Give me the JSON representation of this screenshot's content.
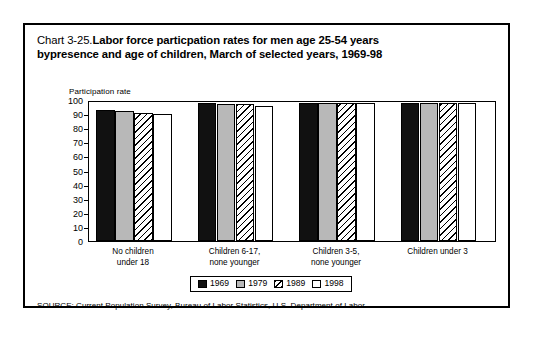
{
  "figure": {
    "title_number": "Chart 3-25.",
    "title_line1_bold": "Labor force particpation rates for men age 25-54 years",
    "title_line2": "bypresence and age of children, March of selected years, 1969-98",
    "axis_title": "Participation rate",
    "source": "SOURCE: Current Population Survey, Bureau of Labor Statistics, U.S. Department of Labor"
  },
  "chart_data": {
    "type": "bar",
    "xlabel": "",
    "ylabel": "Participation rate",
    "ylim": [
      0,
      100
    ],
    "yticks": [
      0,
      10,
      20,
      30,
      40,
      50,
      60,
      70,
      80,
      90,
      100
    ],
    "ytick_labels": [
      "0",
      "10",
      "20",
      "30",
      "40",
      "50",
      "60",
      "70",
      "80",
      "90",
      "100"
    ],
    "grid": false,
    "legend_position": "bottom-center",
    "categories": [
      "No children under 18",
      "Children 6-17, none younger",
      "Children 3-5, none younger",
      "Children under 3"
    ],
    "category_lines": [
      [
        "No children",
        "under 18"
      ],
      [
        "Children 6-17,",
        "none younger"
      ],
      [
        "Children 3-5,",
        "none younger"
      ],
      [
        "Children under 3"
      ]
    ],
    "series": [
      {
        "name": "1969",
        "fill": "black",
        "color": "#111111",
        "values": [
          93,
          98,
          98,
          98
        ]
      },
      {
        "name": "1979",
        "fill": "gray",
        "color": "#b8b8b8",
        "values": [
          92,
          97,
          98,
          98
        ]
      },
      {
        "name": "1989",
        "fill": "hatch",
        "color": "#ffffff",
        "values": [
          91,
          97,
          98,
          98
        ]
      },
      {
        "name": "1998",
        "fill": "white",
        "color": "#ffffff",
        "values": [
          90,
          96,
          98,
          98
        ]
      }
    ]
  },
  "legend": {
    "items": [
      {
        "label": "1969"
      },
      {
        "label": "1979"
      },
      {
        "label": "1989"
      },
      {
        "label": "1998"
      }
    ]
  }
}
